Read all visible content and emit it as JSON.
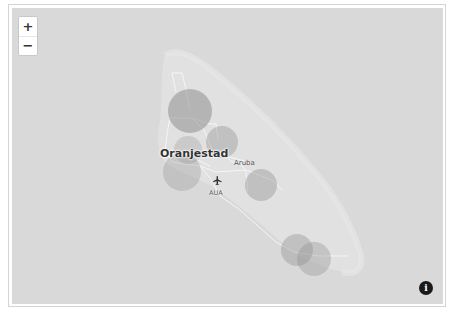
{
  "map": {
    "colors": {
      "sea": "#d9d9d9",
      "land": "#e3e3e3",
      "road": "#f7f7f7",
      "bubble": "#9a9a9a",
      "frame": "#d4d4d4"
    },
    "controls": {
      "zoom_in_label": "+",
      "zoom_out_label": "−",
      "info_label": "i"
    },
    "labels": {
      "city": "Oranjestad",
      "island": "Aruba",
      "airport": "AUA"
    },
    "icons": {
      "airport": "airplane-icon",
      "info": "info-icon"
    },
    "bubbles": [
      {
        "cx": 178,
        "cy": 103,
        "r": 22,
        "opacity": 0.55
      },
      {
        "cx": 210,
        "cy": 134,
        "r": 16,
        "opacity": 0.38
      },
      {
        "cx": 180,
        "cy": 146,
        "r": 14,
        "opacity": 0.3
      },
      {
        "cx": 185,
        "cy": 170,
        "r": 20,
        "opacity": 0.32
      },
      {
        "cx": 248,
        "cy": 176,
        "r": 16,
        "opacity": 0.4
      },
      {
        "cx": 284,
        "cy": 242,
        "r": 16,
        "opacity": 0.38
      },
      {
        "cx": 302,
        "cy": 251,
        "r": 17,
        "opacity": 0.36
      }
    ]
  }
}
